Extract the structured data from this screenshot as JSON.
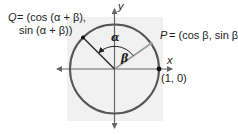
{
  "diagram": {
    "colors": {
      "background_panel": "#f1f1f1",
      "circle": "#555555",
      "axes": "#666666",
      "q_radius": "#333333",
      "p_radius": "#9a9a9a",
      "point": "#111111",
      "text": "#222222"
    },
    "axes": {
      "x_label": "x",
      "y_label": "y"
    },
    "points": {
      "Q": {
        "name": "Q",
        "line1": "= (cos (α + β),",
        "line2": "sin (α + β))"
      },
      "P": {
        "name": "P",
        "coords": "= (cos β, sin β)"
      },
      "unit": {
        "label": "(1, 0)"
      }
    },
    "angles": {
      "alpha": "α",
      "beta": "β"
    }
  }
}
